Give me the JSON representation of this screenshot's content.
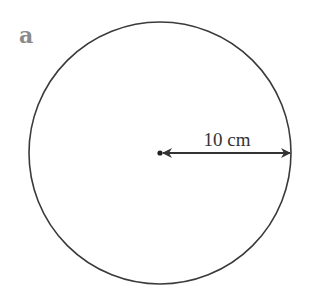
{
  "figure": {
    "label": "a",
    "shape": "circle",
    "radius_label": "10 cm",
    "colors": {
      "outline": "#3a3a3a",
      "label": "#8a8a8a",
      "text": "#333333"
    }
  }
}
